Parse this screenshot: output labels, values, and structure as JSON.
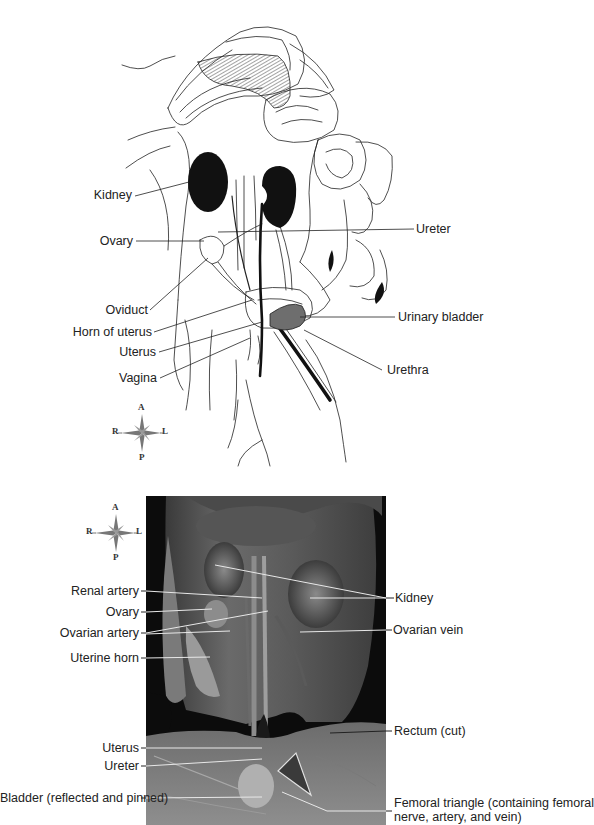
{
  "figure": {
    "drawing": {
      "title": "Female cat urogenital system (line drawing, ventral view)",
      "labels": {
        "kidney": "Kidney",
        "ovary": "Ovary",
        "oviduct": "Oviduct",
        "horn_of_uterus": "Horn of uterus",
        "uterus": "Uterus",
        "vagina": "Vagina",
        "ureter": "Ureter",
        "urinary_bladder": "Urinary bladder",
        "urethra": "Urethra"
      },
      "compass": {
        "anterior": "A",
        "posterior": "P",
        "right": "R",
        "left": "L"
      }
    },
    "photo": {
      "title": "Female cat urogenital dissection (photograph)",
      "compass": {
        "anterior": "A",
        "posterior": "P",
        "right": "R",
        "left": "L"
      },
      "labels": {
        "renal_artery": "Renal artery",
        "ovary": "Ovary",
        "ovarian_artery": "Ovarian artery",
        "uterine_horn": "Uterine horn",
        "uterus": "Uterus",
        "ureter": "Ureter",
        "bladder": "Bladder (reflected and pinned)",
        "kidney": "Kidney",
        "ovarian_vein": "Ovarian vein",
        "rectum": "Rectum (cut)",
        "femoral_triangle_1": "Femoral triangle (containing femoral",
        "femoral_triangle_2": "nerve, artery, and vein)"
      }
    },
    "colors": {
      "line": "#222222",
      "organ_fill": "#111111",
      "bladder_fill": "#6e6e6e",
      "photo_bg": "#0c0c0c",
      "leader_light": "#e8e8e8"
    }
  }
}
